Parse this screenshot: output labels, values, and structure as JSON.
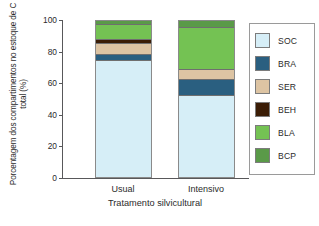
{
  "chart_data": {
    "type": "bar",
    "stacked": true,
    "title": "",
    "xlabel": "Tratamento silvicultural",
    "ylabel": "Porcentagem dos compartimentos no estoque de C total (%)",
    "categories": [
      "Usual",
      "Intensivo"
    ],
    "ylim": [
      0,
      100
    ],
    "yticks": [
      0,
      20,
      40,
      60,
      80,
      100
    ],
    "ytick_labels": [
      "0",
      "20",
      "40",
      "60",
      "80",
      "100"
    ],
    "grid": false,
    "legend_position": "right",
    "series": [
      {
        "name": "SOC",
        "color": "#d6eef7",
        "values": [
          74.7,
          52.5
        ]
      },
      {
        "name": "BRA",
        "color": "#2a5f80",
        "values": [
          4.4,
          10.2
        ]
      },
      {
        "name": "SER",
        "color": "#ddc4a3",
        "values": [
          7.0,
          6.3
        ]
      },
      {
        "name": "BEH",
        "color": "#3b1d06",
        "values": [
          2.5,
          0.0
        ]
      },
      {
        "name": "BLA",
        "color": "#74c253",
        "values": [
          9.5,
          27.2
        ]
      },
      {
        "name": "BCP",
        "color": "#5a9a48",
        "values": [
          1.9,
          3.8
        ]
      }
    ],
    "stack_order_bottom_to_top": [
      "SOC",
      "BRA",
      "SER",
      "BEH",
      "BLA",
      "BCP"
    ]
  },
  "legend": {
    "items": [
      {
        "label": "SOC",
        "color": "#d6eef7"
      },
      {
        "label": "BRA",
        "color": "#2a5f80"
      },
      {
        "label": "SER",
        "color": "#ddc4a3"
      },
      {
        "label": "BEH",
        "color": "#3b1d06"
      },
      {
        "label": "BLA",
        "color": "#74c253"
      },
      {
        "label": "BCP",
        "color": "#5a9a48"
      }
    ]
  }
}
